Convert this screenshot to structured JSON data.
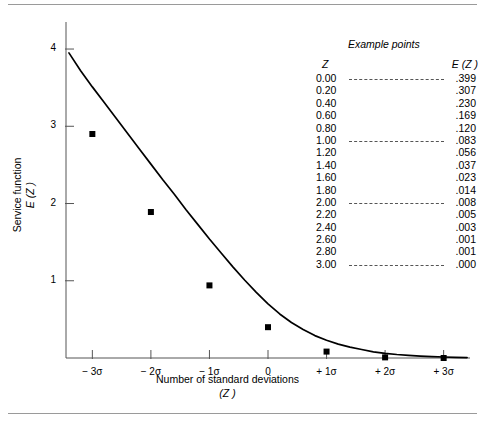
{
  "figure": {
    "y_axis_title_line1": "Service function",
    "y_axis_title_line2_italic": "E (Z )",
    "x_axis_title_line1": "Number of standard deviations",
    "x_axis_title_line2_italic": "(Z )",
    "example_heading": "Example points",
    "table_header_z": "Z",
    "table_header_ez": "E (Z )"
  },
  "chart_data": {
    "type": "line",
    "title": "",
    "xlabel": "Number of standard deviations (Z)",
    "ylabel": "Service function E (Z)",
    "xlim": [
      -3.45,
      3.45
    ],
    "ylim": [
      0,
      4.35
    ],
    "grid": false,
    "legend": "none",
    "x_tick_labels": [
      "− 3σ",
      "− 2σ",
      "− 1σ",
      "0",
      "+ 1σ",
      "+ 2σ",
      "+ 3σ"
    ],
    "x_tick_values": [
      -3,
      -2,
      -1,
      0,
      1,
      2,
      3
    ],
    "y_tick_labels": [
      "1",
      "2",
      "3",
      "4"
    ],
    "y_tick_values": [
      1,
      2,
      3,
      4
    ],
    "series": [
      {
        "name": "E (Z )",
        "marker_x": [
          -3,
          -2,
          -1,
          0,
          1,
          2,
          3
        ],
        "marker_y": [
          2.9,
          1.89,
          0.94,
          0.399,
          0.083,
          0.008,
          0.0
        ],
        "curve_x": [
          -3.4,
          -3.2,
          -3.0,
          -2.8,
          -2.6,
          -2.4,
          -2.2,
          -2.0,
          -1.8,
          -1.6,
          -1.4,
          -1.2,
          -1.0,
          -0.8,
          -0.6,
          -0.4,
          -0.2,
          0.0,
          0.2,
          0.4,
          0.6,
          0.8,
          1.0,
          1.2,
          1.4,
          1.6,
          1.8,
          2.0,
          2.2,
          2.4,
          2.6,
          2.8,
          3.0,
          3.2,
          3.4
        ],
        "curve_y": [
          3.95,
          3.72,
          3.51,
          3.31,
          3.11,
          2.91,
          2.71,
          2.51,
          2.31,
          2.12,
          1.92,
          1.73,
          1.54,
          1.36,
          1.18,
          1.01,
          0.85,
          0.7,
          0.57,
          0.46,
          0.37,
          0.29,
          0.23,
          0.18,
          0.14,
          0.11,
          0.08,
          0.06,
          0.045,
          0.034,
          0.025,
          0.018,
          0.013,
          0.009,
          0.006
        ]
      }
    ],
    "table": {
      "columns": [
        "Z",
        "E (Z )"
      ],
      "rows": [
        {
          "z": "0.00",
          "ez": ".399",
          "leader": true
        },
        {
          "z": "0.20",
          "ez": ".307",
          "leader": false
        },
        {
          "z": "0.40",
          "ez": ".230",
          "leader": false
        },
        {
          "z": "0.60",
          "ez": ".169",
          "leader": false
        },
        {
          "z": "0.80",
          "ez": ".120",
          "leader": false
        },
        {
          "z": "1.00",
          "ez": ".083",
          "leader": true
        },
        {
          "z": "1.20",
          "ez": ".056",
          "leader": false
        },
        {
          "z": "1.40",
          "ez": ".037",
          "leader": false
        },
        {
          "z": "1.60",
          "ez": ".023",
          "leader": false
        },
        {
          "z": "1.80",
          "ez": ".014",
          "leader": false
        },
        {
          "z": "2.00",
          "ez": ".008",
          "leader": true
        },
        {
          "z": "2.20",
          "ez": ".005",
          "leader": false
        },
        {
          "z": "2.40",
          "ez": ".003",
          "leader": false
        },
        {
          "z": "2.60",
          "ez": ".001",
          "leader": false
        },
        {
          "z": "2.80",
          "ez": ".001",
          "leader": false
        },
        {
          "z": "3.00",
          "ez": ".000",
          "leader": true
        }
      ]
    },
    "colors": {
      "curve": "#000000",
      "marker": "#000000",
      "axis": "#555555",
      "rule": "#9a9a9a",
      "background": "#ffffff"
    }
  }
}
